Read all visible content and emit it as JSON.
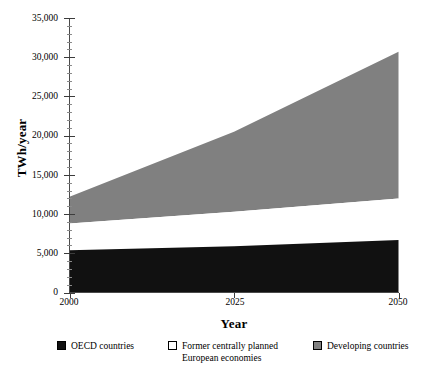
{
  "chart_data": {
    "type": "area",
    "title": "",
    "subtitle": "",
    "xlabel": "Year",
    "ylabel": "TWh/year",
    "stacked": true,
    "grid": false,
    "legend_position": "bottom",
    "x": [
      2000,
      2025,
      2050
    ],
    "xlim": [
      2000,
      2050
    ],
    "ylim": [
      0,
      35000
    ],
    "x_tick_labels": [
      "2000",
      "2025",
      "2050"
    ],
    "y_tick_labels": [
      "0",
      "5,000",
      "10,000",
      "15,000",
      "20,000",
      "25,000",
      "30,000",
      "35,000"
    ],
    "y_ticks": [
      0,
      5000,
      10000,
      15000,
      20000,
      25000,
      30000,
      35000
    ],
    "series": [
      {
        "name": "OECD countries",
        "color": "#111111",
        "values": [
          5400,
          5900,
          6700
        ],
        "cumulative_top": [
          5400,
          5900,
          6700
        ]
      },
      {
        "name": "Former centrally planned European economies",
        "color": "#ffffff",
        "values": [
          3400,
          4400,
          5300
        ],
        "cumulative_top": [
          8800,
          10300,
          12000
        ]
      },
      {
        "name": "Developing countries",
        "color": "#808080",
        "values": [
          3400,
          10200,
          18700
        ],
        "cumulative_top": [
          12200,
          20500,
          30700
        ]
      }
    ]
  },
  "legend": {
    "items": [
      {
        "label": "OECD countries",
        "label_line2": "",
        "swatch": "black-swatch-icon"
      },
      {
        "label": "Former centrally planned",
        "label_line2": "European economies",
        "swatch": "white-swatch-icon"
      },
      {
        "label": "Developing countries",
        "label_line2": "",
        "swatch": "gray-swatch-icon"
      }
    ]
  },
  "axis_titles": {
    "x": "Year",
    "y": "TWh/year"
  }
}
